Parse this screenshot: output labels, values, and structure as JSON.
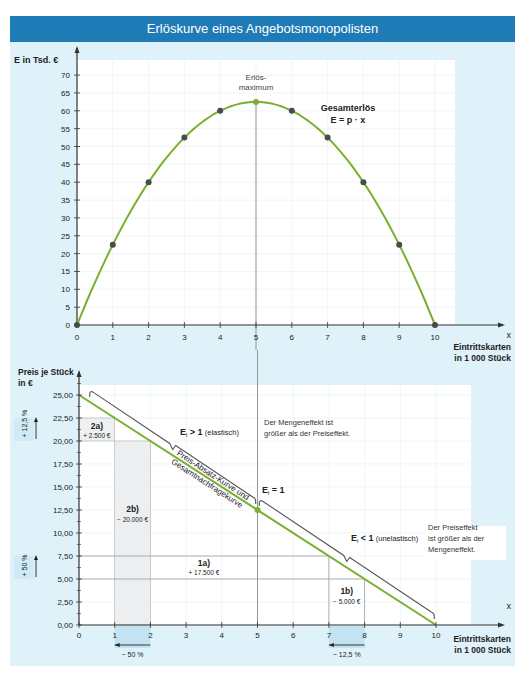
{
  "title": "Erlöskurve eines Angebotsmonopolisten",
  "colors": {
    "title_bar": "#1f7bb5",
    "background": "#dff1f9",
    "curve": "#79b030",
    "point": "#4a4a4a",
    "brace": "#555555"
  },
  "chart_data": [
    {
      "type": "line",
      "title": "Erlöskurve eines Angebotsmonopolisten",
      "xlabel": "x Eintrittskarten in 1 000 Stück",
      "ylabel": "E in Tsd. €",
      "x": [
        0,
        1,
        2,
        3,
        4,
        5,
        6,
        7,
        8,
        9,
        10
      ],
      "series": [
        {
          "name": "Gesamterlös E = p · x",
          "values": [
            0,
            22.5,
            40,
            52.5,
            60,
            62.5,
            60,
            52.5,
            40,
            22.5,
            0
          ]
        }
      ],
      "xticks": [
        "0",
        "1",
        "2",
        "3",
        "4",
        "5",
        "6",
        "7",
        "8",
        "9",
        "10"
      ],
      "yticks": [
        "0",
        "5",
        "10",
        "15",
        "20",
        "25",
        "30",
        "35",
        "40",
        "45",
        "50",
        "55",
        "60",
        "65",
        "70"
      ],
      "xlim": [
        0,
        10
      ],
      "ylim": [
        0,
        70
      ],
      "grid": true,
      "annotations": [
        "Erlös-",
        "maximum",
        "Gesamterlös",
        "E = p · x"
      ]
    },
    {
      "type": "line",
      "title": "Preis-Absatz-Kurve und Gesamtnachfragekurve",
      "xlabel": "x Eintrittskarten in 1 000 Stück",
      "ylabel": "Preis je Stück in €",
      "x": [
        0,
        10
      ],
      "series": [
        {
          "name": "Preis-Absatz-Kurve und Gesamtnachfragekurve",
          "values": [
            25.0,
            0.0
          ]
        }
      ],
      "xticks": [
        "0",
        "1",
        "2",
        "3",
        "4",
        "5",
        "6",
        "7",
        "8",
        "9",
        "10"
      ],
      "yticks": [
        "0,00",
        "2,50",
        "5,00",
        "7,50",
        "10,00",
        "12,50",
        "15,00",
        "17,50",
        "20,00",
        "22,50",
        "25,00"
      ],
      "xlim": [
        0,
        10
      ],
      "ylim": [
        0,
        25
      ],
      "grid": true,
      "annotations": [
        "E_I > 1 (elastisch)",
        "Der Mengeneffekt ist größer als der Preiseffekt.",
        "E_I = 1",
        "E_I < 1 (unelastisch)",
        "Der Preiseffekt ist größer als der Mengeneffekt.",
        "1a) + 17.500 €",
        "1b) − 5.000 €",
        "2a) + 2.500 €",
        "2b) − 20.000 €",
        "+ 12,5 %",
        "+ 50 %",
        "− 50 %",
        "− 12,5 %"
      ]
    }
  ],
  "top": {
    "ylabel": "E in Tsd. €",
    "xvar": "x",
    "xlabel_line1": "Eintrittskarten",
    "xlabel_line2": "in 1 000 Stück",
    "max_label_1": "Erlös-",
    "max_label_2": "maximum",
    "curve_label_1": "Gesamterlös",
    "curve_label_2": "E = p · x"
  },
  "bottom": {
    "ylabel_1": "Preis je Stück",
    "ylabel_2": "in €",
    "xvar": "x",
    "xlabel_line1": "Eintrittskarten",
    "xlabel_line2": "in 1 000 Stück",
    "curve_label_1": "Preis-Absatz-Kurve und",
    "curve_label_2": "Gesamtnachfragekurve",
    "elastic": "E",
    "elastic_sub": "l",
    "elastic_gt": " > 1",
    "elastic_gt_note": "(elastisch)",
    "elastic_eq": " = 1",
    "elastic_lt": " < 1",
    "elastic_lt_note": "(unelastisch)",
    "note_quantity_1": "Der Mengeneffekt ist",
    "note_quantity_2": "größer als der Preiseffekt.",
    "note_price_1": "Der Preiseffekt",
    "note_price_2": "ist größer als der",
    "note_price_3": "Mengeneffekt.",
    "box_1a_label": "1a)",
    "box_1a_value": "+ 17.500 €",
    "box_1b_label": "1b)",
    "box_1b_value": "− 5.000 €",
    "box_2a_label": "2a)",
    "box_2a_value": "+ 2.500 €",
    "box_2b_label": "2b)",
    "box_2b_value": "− 20.000 €",
    "pct_plus_12_5": "+ 12,5 %",
    "pct_plus_50": "+ 50 %",
    "pct_minus_50": "− 50 %",
    "pct_minus_12_5": "− 12,5 %"
  }
}
